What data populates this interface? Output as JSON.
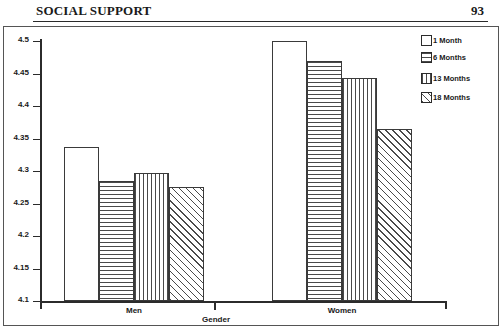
{
  "header": {
    "title": "SOCIAL SUPPORT",
    "page_number": "93"
  },
  "chart_data": {
    "type": "bar",
    "title": "",
    "xlabel": "Gender",
    "ylabel": "",
    "categories": [
      "Men",
      "Women"
    ],
    "series": [
      {
        "name": "1 Month",
        "pattern": "solid",
        "values": [
          4.337,
          4.5
        ]
      },
      {
        "name": "6 Months",
        "pattern": "horizontal",
        "values": [
          4.285,
          4.469
        ]
      },
      {
        "name": "13 Months",
        "pattern": "vertical",
        "values": [
          4.297,
          4.443
        ]
      },
      {
        "name": "18 Months",
        "pattern": "diagonal",
        "values": [
          4.275,
          4.365
        ]
      }
    ],
    "ylim": [
      4.1,
      4.5
    ],
    "yticks": [
      "4.5",
      "4.45",
      "4.4",
      "4.35",
      "4.3",
      "4.25",
      "4.2",
      "4.15",
      "4.1"
    ],
    "grid": false,
    "legend_position": "right"
  },
  "legend": {
    "entries": [
      {
        "label": "1 Month"
      },
      {
        "label": "6 Months"
      },
      {
        "label": "13 Months"
      },
      {
        "label": "18 Months"
      }
    ]
  },
  "colors": {
    "ink": "#1a1a1a",
    "axis": "#2b2b2b",
    "bar_outline": "#3a3a3a",
    "hatch": "#4a4a4a",
    "background": "#ffffff"
  }
}
